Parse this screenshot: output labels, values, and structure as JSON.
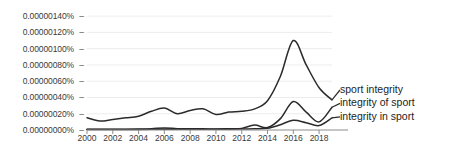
{
  "chart_data": {
    "type": "line",
    "title": "",
    "xlabel": "",
    "ylabel": "",
    "x": [
      2000,
      2001,
      2002,
      2003,
      2004,
      2005,
      2006,
      2007,
      2008,
      2009,
      2010,
      2011,
      2012,
      2013,
      2014,
      2015,
      2016,
      2017,
      2018,
      2019
    ],
    "xlim": [
      2000,
      2019
    ],
    "ylim": [
      0.0,
      1.5e-06
    ],
    "grid": true,
    "legend_position": "right",
    "y_tick_labels": [
      "0.00000140%",
      "0.00000120%",
      "0.00000100%",
      "0.00000080%",
      "0.00000060%",
      "0.00000040%",
      "0.00000020%",
      "0.00000000%"
    ],
    "y_tick_values": [
      1.4e-06,
      1.2e-06,
      1e-06,
      8e-07,
      6e-07,
      4e-07,
      2e-07,
      0.0
    ],
    "x_tick_labels": [
      "2000",
      "2002",
      "2004",
      "2006",
      "2008",
      "2010",
      "2012",
      "2014",
      "2016",
      "2018"
    ],
    "x_tick_values": [
      2000,
      2002,
      2004,
      2006,
      2008,
      2010,
      2012,
      2014,
      2016,
      2018
    ],
    "series": [
      {
        "name": "sport integrity",
        "color": "#2b2b2b",
        "values": [
          1.5e-07,
          1.1e-07,
          1.3e-07,
          1.5e-07,
          1.7e-07,
          2.3e-07,
          2.7e-07,
          2e-07,
          2.4e-07,
          2.6e-07,
          1.9e-07,
          2.2e-07,
          2.3e-07,
          2.6e-07,
          3.6e-07,
          6.6e-07,
          1.1e-06,
          8e-07,
          5.2e-07,
          3.7e-07
        ]
      },
      {
        "name": "integrity of sport",
        "color": "#2b2b2b",
        "values": [
          1e-08,
          1e-08,
          1e-08,
          1e-08,
          1.2e-08,
          1.6e-08,
          2.6e-08,
          1.6e-08,
          1.4e-08,
          1.4e-08,
          1.3e-08,
          1.6e-08,
          2e-08,
          6e-08,
          3e-08,
          1.4e-07,
          3.5e-07,
          2.2e-07,
          1e-07,
          2.8e-07
        ]
      },
      {
        "name": "integrity in sport",
        "color": "#2b2b2b",
        "values": [
          5e-09,
          5e-09,
          5e-09,
          5e-09,
          6e-09,
          8e-09,
          1e-08,
          8e-09,
          8e-09,
          8e-09,
          9e-09,
          1e-08,
          1.2e-08,
          1.6e-08,
          2.2e-08,
          6.5e-08,
          1.2e-07,
          9e-08,
          5.5e-08,
          1.5e-07
        ]
      }
    ]
  },
  "axis": {
    "tick_dash": "–"
  },
  "legend": {
    "entries": [
      {
        "label": "sport integrity"
      },
      {
        "label": "integrity of sport"
      },
      {
        "label": "integrity in sport"
      }
    ]
  }
}
